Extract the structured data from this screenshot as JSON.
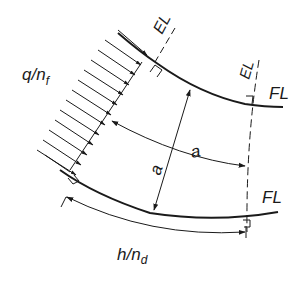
{
  "diagram": {
    "type": "engineering-diagram",
    "labels": {
      "load": "q/n",
      "load_sub": "f",
      "edge_line_top": "EL",
      "edge_line_right": "EL",
      "flange_line_top": "FL",
      "flange_line_bottom": "FL",
      "dim_a_radial": "a",
      "dim_a_arc": "a",
      "dim_h": "h/n",
      "dim_h_sub": "d"
    },
    "colors": {
      "stroke": "#1a1a1a",
      "background": "#ffffff"
    },
    "load_arrow_count": 14
  }
}
